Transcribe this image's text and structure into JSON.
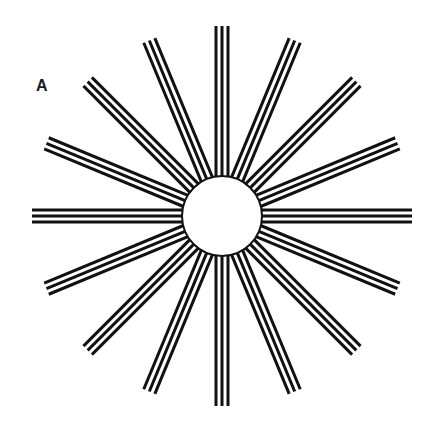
{
  "figure": {
    "panel_label": "A",
    "center": [
      222,
      216
    ],
    "circle_radius": 40,
    "spoke_count": 16,
    "spoke_outer_radius": 190,
    "lines_per_spoke": 3,
    "line_spacing": 6,
    "line_width": 3,
    "colors": {
      "stroke": "#111111",
      "background": "#ffffff",
      "circle_fill": "#ffffff"
    }
  }
}
